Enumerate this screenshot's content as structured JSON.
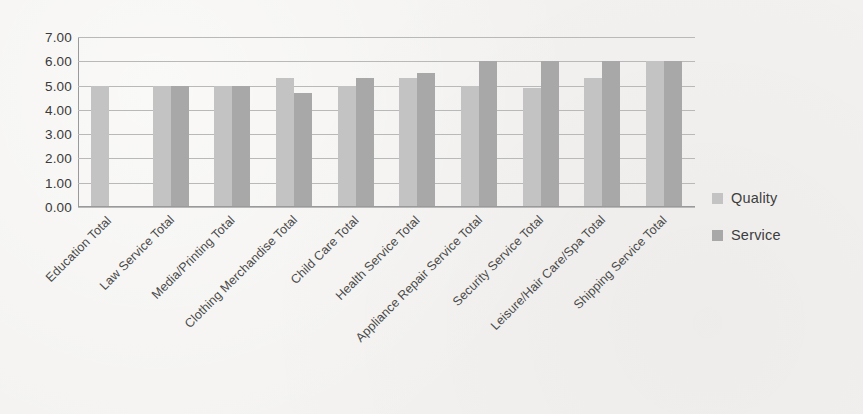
{
  "chart_data": {
    "type": "bar",
    "title": "",
    "subtitle": "",
    "xlabel": "",
    "ylabel": "",
    "ylim": [
      0,
      7
    ],
    "ytick_step": 1,
    "ytick_format": "0.00",
    "ytick_labels": [
      "7.00",
      "6.00",
      "5.00",
      "4.00",
      "3.00",
      "2.00",
      "1.00",
      "0.00"
    ],
    "grid": true,
    "grid_axis": "y",
    "legend_position": "right",
    "categories": [
      "Education Total",
      "Law Service Total",
      "Media/Printing Total",
      "Clothing Merchandise Total",
      "Child Care Total",
      "Health Service Total",
      "Appliance Repair Service Total",
      "Security Service Total",
      "Leisure/Hair Care/Spa Total",
      "Shipping Service Total"
    ],
    "series": [
      {
        "name": "Quality",
        "color": "#c3c3c3",
        "values": [
          5.0,
          5.0,
          5.0,
          5.3,
          5.0,
          5.3,
          5.0,
          4.9,
          5.3,
          6.0
        ]
      },
      {
        "name": "Service",
        "color": "#a8a8a8",
        "values": [
          0.0,
          5.0,
          5.0,
          4.7,
          5.3,
          5.5,
          6.0,
          6.0,
          6.0,
          6.0
        ]
      }
    ]
  },
  "legend": {
    "items": [
      {
        "label": "Quality",
        "swatch": "quality-swatch-icon"
      },
      {
        "label": "Service",
        "swatch": "service-swatch-icon"
      }
    ]
  },
  "colors": {
    "background": "#f3f2f0",
    "quality": "#c3c3c3",
    "service": "#a8a8a8",
    "gridline": "#b9b9b9",
    "axis": "#9a9a9a",
    "text": "#3a3a3a"
  }
}
